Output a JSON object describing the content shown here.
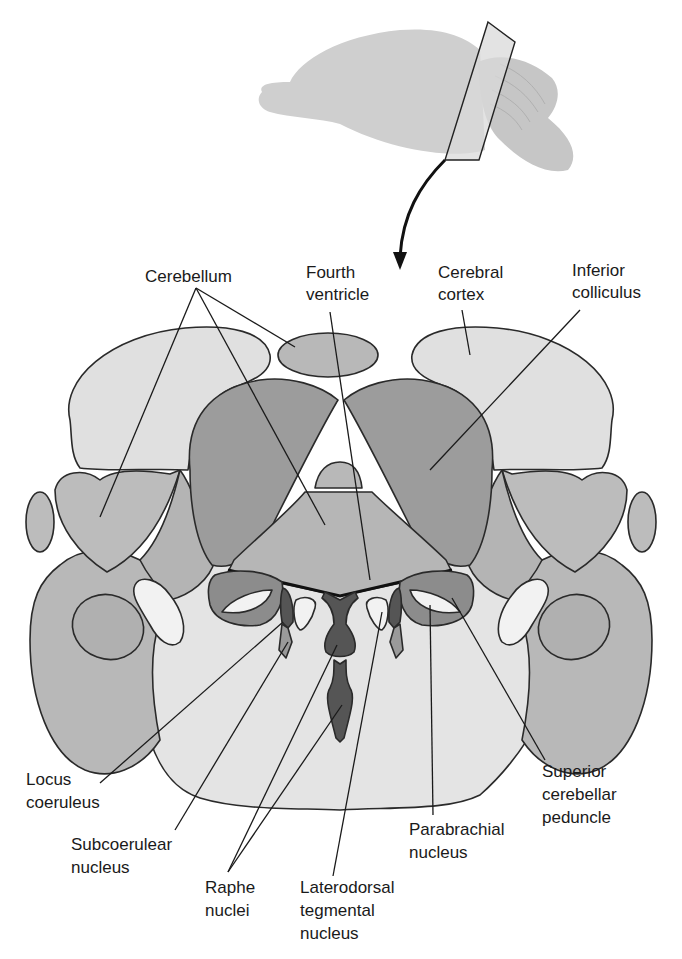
{
  "figure": {
    "inset": "Lateral view of brain with section plane"
  },
  "colors": {
    "background": "#ffffff",
    "outline": "#2a2a2a",
    "pons": "#e4e4e4",
    "cortex": "#e0e0e0",
    "cerebellum": "#b8b8b8",
    "colliculus": "#9a9a9a",
    "peduncle": "#888888",
    "nucleus_dark": "#555555",
    "tract_light": "#f2f2f2",
    "brain_inset": "#d2d2d2"
  },
  "labels": {
    "cerebellum": "Cerebellum",
    "fourth_ventricle": [
      "Fourth",
      "ventricle"
    ],
    "cerebral_cortex": [
      "Cerebral",
      "cortex"
    ],
    "inferior_colliculus": [
      "Inferior",
      "colliculus"
    ],
    "locus_coeruleus": [
      "Locus",
      "coeruleus"
    ],
    "subcoerulear_nucleus": [
      "Subcoerulear",
      "nucleus"
    ],
    "raphe_nuclei": [
      "Raphe",
      "nuclei"
    ],
    "laterodorsal_tegmental_nucleus": [
      "Laterodorsal",
      "tegmental",
      "nucleus"
    ],
    "parabrachial_nucleus": [
      "Parabrachial",
      "nucleus"
    ],
    "superior_cerebellar_peduncle": [
      "Superior",
      "cerebellar",
      "peduncle"
    ]
  }
}
